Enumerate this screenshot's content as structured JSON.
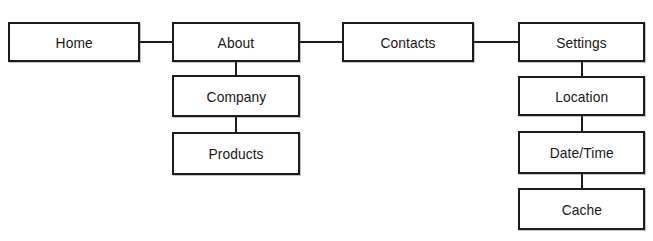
{
  "diagram": {
    "title_fragment": "",
    "background_color": "#ffffff",
    "line_color": "#1c1c1c",
    "text_color": "#171717",
    "nodes": [
      {
        "id": "home",
        "label": "Home",
        "x": 8,
        "y": 22,
        "w": 132,
        "h": 40
      },
      {
        "id": "about",
        "label": "About",
        "x": 172,
        "y": 22,
        "w": 128,
        "h": 40
      },
      {
        "id": "company",
        "label": "Company",
        "x": 172,
        "y": 75,
        "w": 128,
        "h": 42
      },
      {
        "id": "products",
        "label": "Products",
        "x": 172,
        "y": 132,
        "w": 128,
        "h": 43
      },
      {
        "id": "contacts",
        "label": "Contacts",
        "x": 342,
        "y": 22,
        "w": 132,
        "h": 40
      },
      {
        "id": "settings",
        "label": "Settings",
        "x": 518,
        "y": 22,
        "w": 127,
        "h": 40
      },
      {
        "id": "location",
        "label": "Location",
        "x": 518,
        "y": 76,
        "w": 127,
        "h": 40
      },
      {
        "id": "datetime",
        "label": "Date/Time",
        "x": 518,
        "y": 131,
        "w": 127,
        "h": 43
      },
      {
        "id": "cache",
        "label": "Cache",
        "x": 518,
        "y": 188,
        "w": 127,
        "h": 42
      }
    ],
    "connectors": [
      {
        "id": "home-about",
        "orientation": "h",
        "x": 140,
        "y": 41,
        "length": 32
      },
      {
        "id": "about-contacts",
        "orientation": "h",
        "x": 300,
        "y": 41,
        "length": 42
      },
      {
        "id": "contacts-settings",
        "orientation": "h",
        "x": 474,
        "y": 41,
        "length": 44
      },
      {
        "id": "about-company",
        "orientation": "v",
        "x": 235,
        "y": 62,
        "length": 13
      },
      {
        "id": "company-products",
        "orientation": "v",
        "x": 235,
        "y": 117,
        "length": 15
      },
      {
        "id": "settings-location",
        "orientation": "v",
        "x": 581,
        "y": 62,
        "length": 14
      },
      {
        "id": "location-datetime",
        "orientation": "v",
        "x": 581,
        "y": 116,
        "length": 15
      },
      {
        "id": "datetime-cache",
        "orientation": "v",
        "x": 581,
        "y": 174,
        "length": 14
      }
    ]
  }
}
